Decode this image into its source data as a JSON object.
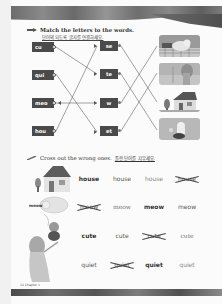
{
  "page": {
    "page_number": "12",
    "chapter_label": "Chapter 1"
  },
  "exercise1": {
    "instruction": "Match the letters to the words.",
    "instruction_ko": "단어의 되도록 글자를 연결하세요.",
    "left_chips": [
      {
        "label": "cu"
      },
      {
        "label": "qui"
      },
      {
        "label": "meo"
      },
      {
        "label": "hou"
      }
    ],
    "middle_chips": [
      {
        "label": "se"
      },
      {
        "label": "te"
      },
      {
        "label": "w"
      },
      {
        "label": "et"
      }
    ],
    "pictures": [
      {
        "name": "cat-picture",
        "word": "meow"
      },
      {
        "name": "quiet-girl-picture",
        "word": "quiet"
      },
      {
        "name": "house-picture",
        "word": "house"
      },
      {
        "name": "cute-puppy-picture",
        "word": "cute"
      }
    ],
    "connections_left_to_middle": [
      {
        "from": "cu",
        "to": "te"
      },
      {
        "from": "qui",
        "to": "et"
      },
      {
        "from": "meo",
        "to": "w"
      },
      {
        "from": "hou",
        "to": "se"
      }
    ],
    "connections_middle_to_picture": [
      {
        "from": "se",
        "to": "house"
      },
      {
        "from": "te",
        "to": "cute"
      },
      {
        "from": "w",
        "to": "meow"
      },
      {
        "from": "et",
        "to": "quiet"
      }
    ]
  },
  "exercise2": {
    "instruction": "Cross out the wrong ones.",
    "instruction_ko": "틀린 단어를 지우세요.",
    "rows": [
      {
        "picture": "house",
        "options": [
          {
            "text": "house",
            "style": "bold",
            "crossed": false
          },
          {
            "text": "house",
            "style": "normal",
            "crossed": false
          },
          {
            "text": "house",
            "style": "light",
            "crossed": false
          },
          {
            "text": "house",
            "style": "normal",
            "crossed": true
          }
        ]
      },
      {
        "picture": "cat",
        "picture_label": "meow",
        "options": [
          {
            "text": "meow",
            "style": "normal",
            "crossed": true
          },
          {
            "text": "meow",
            "style": "thin",
            "crossed": false
          },
          {
            "text": "meow",
            "style": "bold",
            "crossed": false
          },
          {
            "text": "meow",
            "style": "normal",
            "crossed": false
          }
        ]
      },
      {
        "picture": "puppy",
        "options": [
          {
            "text": "cute",
            "style": "bold",
            "crossed": false
          },
          {
            "text": "cute",
            "style": "normal",
            "crossed": false
          },
          {
            "text": "cute",
            "style": "normal",
            "crossed": true
          },
          {
            "text": "cute",
            "style": "thin",
            "crossed": false
          }
        ]
      },
      {
        "picture": "quiet-girl",
        "options": [
          {
            "text": "quiet",
            "style": "normal",
            "crossed": false
          },
          {
            "text": "quiet",
            "style": "normal",
            "crossed": true
          },
          {
            "text": "quiet",
            "style": "bold",
            "crossed": false
          },
          {
            "text": "quiet",
            "style": "light",
            "crossed": false
          }
        ]
      }
    ]
  }
}
